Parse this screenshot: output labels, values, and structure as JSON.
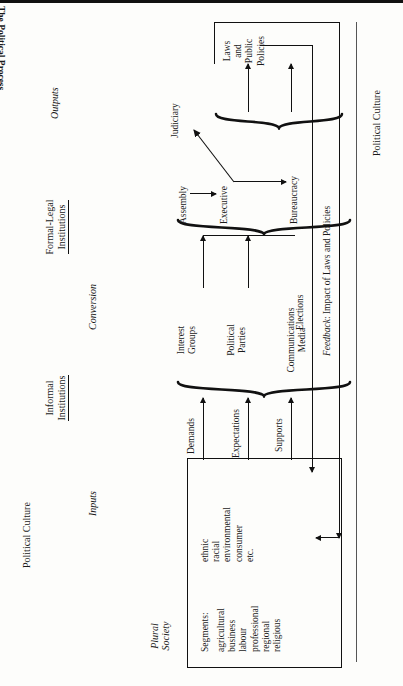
{
  "figure": {
    "title": "The Political Process",
    "page_orientation": "landscape-printed-sideways"
  },
  "environment_labels": {
    "left": "Political Culture",
    "right": "Political Culture"
  },
  "stage_labels": [
    {
      "id": "plural-society",
      "text": "Plural\nSociety",
      "style": "italic"
    },
    {
      "id": "inputs",
      "text": "Inputs",
      "style": "italic"
    },
    {
      "id": "conversion",
      "text": "Conversion",
      "style": "italic"
    },
    {
      "id": "outputs",
      "text": "Outputs",
      "style": "italic"
    }
  ],
  "institution_headings": [
    {
      "id": "informal",
      "line1": "Informal",
      "line2": "Institutions"
    },
    {
      "id": "formal-legal",
      "line1": "Formal-Legal",
      "line2": "Institutions"
    }
  ],
  "plural_society_box": {
    "heading": "Segments:",
    "column_a": [
      "agricultural",
      "business",
      "labour",
      "professional",
      "regional",
      "religious"
    ],
    "column_b": [
      "ethnic",
      "racial",
      "environmental",
      "consumer",
      "etc."
    ]
  },
  "inputs": [
    {
      "label": "Demands"
    },
    {
      "label": "Expectations"
    },
    {
      "label": "Supports"
    }
  ],
  "informal_institutions": [
    {
      "line1": "Interest",
      "line2": "Groups"
    },
    {
      "line1": "Political",
      "line2": "Parties"
    },
    {
      "line1": "Communications",
      "line2": "Media"
    }
  ],
  "formal_legal_institutions": [
    {
      "id": "assembly",
      "label": "Assembly"
    },
    {
      "id": "executive",
      "label": "Executive"
    },
    {
      "id": "judiciary",
      "label": "Judiciary"
    },
    {
      "id": "bureaucracy",
      "label": "Bureaucracy"
    }
  ],
  "outputs": {
    "label": "Laws\nand\nPublic\nPolicies",
    "lines": [
      "Laws",
      "and",
      "Public",
      "Policies"
    ]
  },
  "feedback": {
    "label_em": "Feedback",
    "label_rest": ": Impact of Laws and Policies"
  },
  "elections": {
    "label": "Elections"
  },
  "colors": {
    "ink": "#111111",
    "paper": "#fdfdfb"
  }
}
